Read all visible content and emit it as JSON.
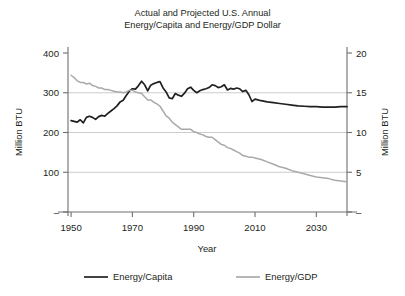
{
  "chart_data": {
    "type": "line",
    "title": "Actual and Projected U.S. Annual Energy/Capita and Energy/GDP Dollar",
    "title_line1": "Actual and Projected U.S. Annual",
    "title_line2": "Energy/Capita and Energy/GDP Dollar",
    "xlabel": "Year",
    "ylabel_left": "Million BTU",
    "ylabel_right": "Million BTU",
    "xlim": [
      1949,
      2040
    ],
    "ylim_left": [
      0,
      400
    ],
    "ylim_right": [
      0,
      20
    ],
    "xticks": [
      1950,
      1970,
      1990,
      2010,
      2030
    ],
    "xtick_labels": [
      "1950",
      "1970",
      "1990",
      "2010",
      "2030"
    ],
    "yticks_left": [
      0,
      100,
      200,
      300,
      400
    ],
    "ytick_labels_left": [
      "–",
      "100",
      "200",
      "300",
      "400"
    ],
    "yticks_right": [
      0,
      5,
      10,
      15,
      20
    ],
    "ytick_labels_right": [
      "–",
      "5",
      "10",
      "15",
      "20"
    ],
    "grid": true,
    "gridlines_left": [
      100,
      200,
      300
    ],
    "legend_position": "bottom",
    "series": [
      {
        "name": "Energy/Capita",
        "axis": "left",
        "color": "#231f20",
        "width": 1.7,
        "x": [
          1950,
          1951,
          1952,
          1953,
          1954,
          1955,
          1956,
          1957,
          1958,
          1959,
          1960,
          1961,
          1962,
          1963,
          1964,
          1965,
          1966,
          1967,
          1968,
          1969,
          1970,
          1971,
          1972,
          1973,
          1974,
          1975,
          1976,
          1977,
          1978,
          1979,
          1980,
          1981,
          1982,
          1983,
          1984,
          1985,
          1986,
          1987,
          1988,
          1989,
          1990,
          1991,
          1992,
          1993,
          1994,
          1995,
          1996,
          1997,
          1998,
          1999,
          2000,
          2001,
          2002,
          2003,
          2004,
          2005,
          2006,
          2007,
          2008,
          2009,
          2010,
          2012,
          2014,
          2016,
          2018,
          2020,
          2022,
          2024,
          2026,
          2028,
          2030,
          2032,
          2034,
          2036,
          2038,
          2040
        ],
        "values": [
          230,
          228,
          226,
          232,
          224,
          238,
          241,
          238,
          233,
          240,
          243,
          241,
          248,
          254,
          260,
          267,
          277,
          281,
          293,
          304,
          310,
          309,
          318,
          329,
          320,
          305,
          319,
          323,
          326,
          328,
          312,
          302,
          287,
          285,
          298,
          294,
          291,
          299,
          310,
          314,
          306,
          300,
          305,
          308,
          310,
          313,
          320,
          318,
          313,
          315,
          320,
          307,
          311,
          309,
          312,
          310,
          303,
          306,
          295,
          278,
          284,
          280,
          277,
          275,
          273,
          271,
          269,
          267,
          266,
          265,
          265,
          264,
          264,
          264,
          265,
          265
        ]
      },
      {
        "name": "Energy/GDP",
        "axis": "right",
        "color": "#a7a9ac",
        "width": 1.5,
        "x": [
          1950,
          1951,
          1952,
          1953,
          1954,
          1955,
          1956,
          1957,
          1958,
          1959,
          1960,
          1961,
          1962,
          1963,
          1964,
          1965,
          1966,
          1967,
          1968,
          1969,
          1970,
          1971,
          1972,
          1973,
          1974,
          1975,
          1976,
          1977,
          1978,
          1979,
          1980,
          1981,
          1982,
          1983,
          1984,
          1985,
          1986,
          1987,
          1988,
          1989,
          1990,
          1991,
          1992,
          1993,
          1994,
          1995,
          1996,
          1997,
          1998,
          1999,
          2000,
          2001,
          2002,
          2003,
          2004,
          2005,
          2006,
          2007,
          2008,
          2009,
          2010,
          2012,
          2014,
          2016,
          2018,
          2020,
          2022,
          2024,
          2026,
          2028,
          2030,
          2032,
          2034,
          2036,
          2038,
          2040
        ],
        "values": [
          17.2,
          16.9,
          16.5,
          16.3,
          16.3,
          16.1,
          16.2,
          15.9,
          15.8,
          15.6,
          15.6,
          15.4,
          15.4,
          15.3,
          15.2,
          15.1,
          15.1,
          15.0,
          15.1,
          15.3,
          15.3,
          15.1,
          15.0,
          14.9,
          14.5,
          14.1,
          14.1,
          13.8,
          13.6,
          13.3,
          12.7,
          12.1,
          11.8,
          11.3,
          11.0,
          10.7,
          10.4,
          10.4,
          10.4,
          10.4,
          10.1,
          10.0,
          9.8,
          9.7,
          9.5,
          9.4,
          9.4,
          9.1,
          8.8,
          8.5,
          8.4,
          8.1,
          8.0,
          7.8,
          7.6,
          7.4,
          7.1,
          7.0,
          6.9,
          6.9,
          6.8,
          6.6,
          6.3,
          6.0,
          5.7,
          5.5,
          5.2,
          5.0,
          4.8,
          4.6,
          4.4,
          4.3,
          4.2,
          4.0,
          3.9,
          3.8
        ]
      }
    ]
  },
  "legend": {
    "items": [
      {
        "label": "Energy/Capita",
        "color": "#231f20"
      },
      {
        "label": "Energy/GDP",
        "color": "#a7a9ac"
      }
    ]
  }
}
